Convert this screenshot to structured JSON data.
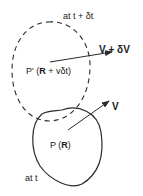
{
  "diagram": {
    "colors": {
      "stroke": "#2a2a2a",
      "background": "#ffffff"
    },
    "later_region": {
      "style": "dashed",
      "time_label": "at  t + δt",
      "point_label": {
        "prefix": "P' (",
        "bold": "R",
        "suffix": " + vδt)"
      },
      "velocity_label": "V + δV"
    },
    "initial_region": {
      "style": "solid",
      "time_label": "at  t",
      "point_label": {
        "prefix": "P (",
        "bold": "R",
        "suffix": ")"
      },
      "velocity_label": "V"
    }
  }
}
